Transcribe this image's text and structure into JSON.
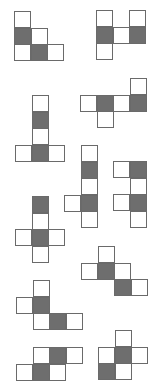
{
  "diagram": {
    "colors": {
      "background": "#ffffff",
      "shaded": "#6e6e6e",
      "border": "#6a6a6a"
    },
    "cell_size": 16.5,
    "figures": [
      {
        "id": 1,
        "origin": [
          14,
          11
        ],
        "cells": [
          {
            "r": 0,
            "c": 0,
            "shaded": false
          },
          {
            "r": 1,
            "c": 0,
            "shaded": true
          },
          {
            "r": 1,
            "c": 1,
            "shaded": false
          },
          {
            "r": 2,
            "c": 0,
            "shaded": false
          },
          {
            "r": 2,
            "c": 1,
            "shaded": true
          },
          {
            "r": 2,
            "c": 2,
            "shaded": false
          }
        ]
      },
      {
        "id": 2,
        "origin": [
          96,
          10
        ],
        "cells": [
          {
            "r": 0,
            "c": 0,
            "shaded": false
          },
          {
            "r": 0,
            "c": 2,
            "shaded": false
          },
          {
            "r": 1,
            "c": 0,
            "shaded": true
          },
          {
            "r": 1,
            "c": 1,
            "shaded": false
          },
          {
            "r": 1,
            "c": 2,
            "shaded": true
          },
          {
            "r": 2,
            "c": 0,
            "shaded": false
          }
        ]
      },
      {
        "id": 3,
        "origin": [
          15,
          95
        ],
        "cells": [
          {
            "r": 0,
            "c": 1,
            "shaded": false
          },
          {
            "r": 1,
            "c": 1,
            "shaded": true
          },
          {
            "r": 2,
            "c": 1,
            "shaded": false
          },
          {
            "r": 3,
            "c": 0,
            "shaded": false
          },
          {
            "r": 3,
            "c": 1,
            "shaded": true
          },
          {
            "r": 3,
            "c": 2,
            "shaded": false
          }
        ]
      },
      {
        "id": 4,
        "origin": [
          80,
          78
        ],
        "cells": [
          {
            "r": 0,
            "c": 3,
            "shaded": false
          },
          {
            "r": 1,
            "c": 0,
            "shaded": false
          },
          {
            "r": 1,
            "c": 1,
            "shaded": true
          },
          {
            "r": 1,
            "c": 2,
            "shaded": false
          },
          {
            "r": 1,
            "c": 3,
            "shaded": true
          },
          {
            "r": 2,
            "c": 1,
            "shaded": false
          }
        ]
      },
      {
        "id": 5,
        "origin": [
          64,
          145
        ],
        "cells": [
          {
            "r": 0,
            "c": 1,
            "shaded": false
          },
          {
            "r": 1,
            "c": 1,
            "shaded": true
          },
          {
            "r": 2,
            "c": 1,
            "shaded": false
          },
          {
            "r": 3,
            "c": 0,
            "shaded": false
          },
          {
            "r": 3,
            "c": 1,
            "shaded": true
          },
          {
            "r": 4,
            "c": 1,
            "shaded": false
          }
        ]
      },
      {
        "id": 6,
        "origin": [
          113,
          161
        ],
        "cells": [
          {
            "r": 0,
            "c": 0,
            "shaded": false
          },
          {
            "r": 0,
            "c": 1,
            "shaded": true
          },
          {
            "r": 1,
            "c": 1,
            "shaded": false
          },
          {
            "r": 2,
            "c": 0,
            "shaded": false
          },
          {
            "r": 2,
            "c": 1,
            "shaded": true
          },
          {
            "r": 3,
            "c": 1,
            "shaded": false
          }
        ]
      },
      {
        "id": 7,
        "origin": [
          15,
          196
        ],
        "cells": [
          {
            "r": 0,
            "c": 1,
            "shaded": true
          },
          {
            "r": 1,
            "c": 1,
            "shaded": false
          },
          {
            "r": 2,
            "c": 0,
            "shaded": false
          },
          {
            "r": 2,
            "c": 1,
            "shaded": true
          },
          {
            "r": 2,
            "c": 2,
            "shaded": false
          },
          {
            "r": 3,
            "c": 1,
            "shaded": false
          }
        ]
      },
      {
        "id": 8,
        "origin": [
          81,
          246
        ],
        "cells": [
          {
            "r": 0,
            "c": 1,
            "shaded": false
          },
          {
            "r": 1,
            "c": 0,
            "shaded": false
          },
          {
            "r": 1,
            "c": 1,
            "shaded": true
          },
          {
            "r": 1,
            "c": 2,
            "shaded": false
          },
          {
            "r": 2,
            "c": 2,
            "shaded": true
          },
          {
            "r": 2,
            "c": 3,
            "shaded": false
          }
        ]
      },
      {
        "id": 9,
        "origin": [
          16,
          280
        ],
        "cells": [
          {
            "r": 0,
            "c": 1,
            "shaded": false
          },
          {
            "r": 1,
            "c": 0,
            "shaded": false
          },
          {
            "r": 1,
            "c": 1,
            "shaded": true
          },
          {
            "r": 2,
            "c": 1,
            "shaded": false
          },
          {
            "r": 2,
            "c": 2,
            "shaded": true
          },
          {
            "r": 2,
            "c": 3,
            "shaded": false
          }
        ]
      },
      {
        "id": 10,
        "origin": [
          16,
          347
        ],
        "cells": [
          {
            "r": 0,
            "c": 1,
            "shaded": false
          },
          {
            "r": 0,
            "c": 2,
            "shaded": true
          },
          {
            "r": 0,
            "c": 3,
            "shaded": false
          },
          {
            "r": 1,
            "c": 0,
            "shaded": false
          },
          {
            "r": 1,
            "c": 1,
            "shaded": true
          },
          {
            "r": 1,
            "c": 2,
            "shaded": false
          }
        ]
      },
      {
        "id": 11,
        "origin": [
          98,
          330
        ],
        "cells": [
          {
            "r": 0,
            "c": 1,
            "shaded": false
          },
          {
            "r": 1,
            "c": 0,
            "shaded": false
          },
          {
            "r": 1,
            "c": 1,
            "shaded": true
          },
          {
            "r": 1,
            "c": 2,
            "shaded": false
          },
          {
            "r": 2,
            "c": 0,
            "shaded": true
          },
          {
            "r": 2,
            "c": 1,
            "shaded": false
          }
        ]
      }
    ]
  }
}
